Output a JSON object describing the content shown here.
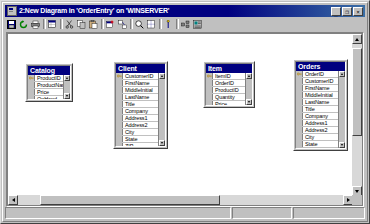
{
  "window": {
    "title": "2:New Diagram in 'OrderEntry' on 'WINSERVER'",
    "app_minimize": "_",
    "app_restore": "❐",
    "app_close": "×",
    "titlebar_color": "#000080"
  },
  "toolbar": {
    "items": [
      {
        "name": "save-button",
        "icon": "save-icon",
        "label": "Save"
      },
      {
        "name": "refresh-button",
        "icon": "refresh-icon",
        "label": "Refresh"
      },
      {
        "name": "print-button",
        "icon": "print-icon",
        "label": "Print"
      },
      {
        "name": "new-table-button",
        "icon": "new-table-icon",
        "label": "New Table"
      },
      {
        "name": "cut-button",
        "icon": "cut-icon",
        "label": "Cut"
      },
      {
        "name": "copy-button",
        "icon": "copy-icon",
        "label": "Copy"
      },
      {
        "name": "paste-button",
        "icon": "paste-icon",
        "label": "Paste"
      },
      {
        "name": "add-table-button",
        "icon": "add-table-icon",
        "label": "Add Table"
      },
      {
        "name": "add-related-tables-button",
        "icon": "add-related-tables-icon",
        "label": "Add Related Tables"
      },
      {
        "name": "zoom-button",
        "icon": "zoom-icon",
        "label": "Zoom"
      },
      {
        "name": "page-break-button",
        "icon": "page-break-icon",
        "label": "Show Page Breaks"
      },
      {
        "name": "relationship-button",
        "icon": "relationship-icon",
        "label": "New Relationship"
      },
      {
        "name": "arrange-tables-button",
        "icon": "arrange-tables-icon",
        "label": "Arrange Tables"
      },
      {
        "name": "properties-button",
        "icon": "properties-icon",
        "label": "Properties"
      }
    ]
  },
  "statusbar": {
    "pane1": "",
    "pane2": "",
    "pane3": ""
  },
  "diagram": {
    "tables": [
      {
        "name": "Catalog",
        "x": 20,
        "y": 58,
        "w": 48,
        "h": 39,
        "columns": [
          {
            "name": "ProductID",
            "pk": true
          },
          {
            "name": "ProductName",
            "pk": false
          },
          {
            "name": "Price",
            "pk": false
          },
          {
            "name": "OnHand",
            "pk": false
          }
        ]
      },
      {
        "name": "Client",
        "x": 108,
        "y": 56,
        "w": 55,
        "h": 88,
        "columns": [
          {
            "name": "CustomerID",
            "pk": true
          },
          {
            "name": "FirstName",
            "pk": false
          },
          {
            "name": "MiddleInitial",
            "pk": false
          },
          {
            "name": "LastName",
            "pk": false
          },
          {
            "name": "Title",
            "pk": false
          },
          {
            "name": "Company",
            "pk": false
          },
          {
            "name": "Address1",
            "pk": false
          },
          {
            "name": "Address2",
            "pk": false
          },
          {
            "name": "City",
            "pk": false
          },
          {
            "name": "State",
            "pk": false
          },
          {
            "name": "ZIP",
            "pk": false
          },
          {
            "name": "Country",
            "pk": false
          }
        ]
      },
      {
        "name": "Item",
        "x": 198,
        "y": 56,
        "w": 52,
        "h": 47,
        "columns": [
          {
            "name": "ItemID",
            "pk": true
          },
          {
            "name": "OrderID",
            "pk": false
          },
          {
            "name": "ProductID",
            "pk": false
          },
          {
            "name": "Quantity",
            "pk": false
          },
          {
            "name": "Price",
            "pk": false
          }
        ]
      },
      {
        "name": "Orders",
        "x": 288,
        "y": 54,
        "w": 55,
        "h": 92,
        "columns": [
          {
            "name": "OrderID",
            "pk": true
          },
          {
            "name": "CustomerID",
            "pk": false
          },
          {
            "name": "FirstName",
            "pk": false
          },
          {
            "name": "MiddleInitial",
            "pk": false
          },
          {
            "name": "LastName",
            "pk": false
          },
          {
            "name": "Title",
            "pk": false
          },
          {
            "name": "Company",
            "pk": false
          },
          {
            "name": "Address1",
            "pk": false
          },
          {
            "name": "Address2",
            "pk": false
          },
          {
            "name": "City",
            "pk": false
          },
          {
            "name": "State",
            "pk": false
          },
          {
            "name": "ZIP",
            "pk": false
          }
        ]
      }
    ]
  },
  "scrollbars": {
    "vertical": {
      "thumb_top": 14,
      "thumb_height": 88
    },
    "horizontal": {
      "thumb_left": 32,
      "thumb_width": 180
    }
  }
}
